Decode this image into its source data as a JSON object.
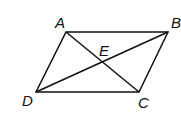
{
  "diagram": {
    "type": "parallelogram-with-diagonals",
    "points": {
      "A": {
        "label": "A",
        "x": 66,
        "y": 32
      },
      "B": {
        "label": "B",
        "x": 168,
        "y": 32
      },
      "C": {
        "label": "C",
        "x": 139,
        "y": 92
      },
      "D": {
        "label": "D",
        "x": 36,
        "y": 92
      },
      "E": {
        "label": "E",
        "x": 101,
        "y": 62
      }
    },
    "segments": [
      "AB",
      "BC",
      "CD",
      "DA",
      "AC",
      "BD"
    ],
    "stroke_color": "#111111"
  }
}
